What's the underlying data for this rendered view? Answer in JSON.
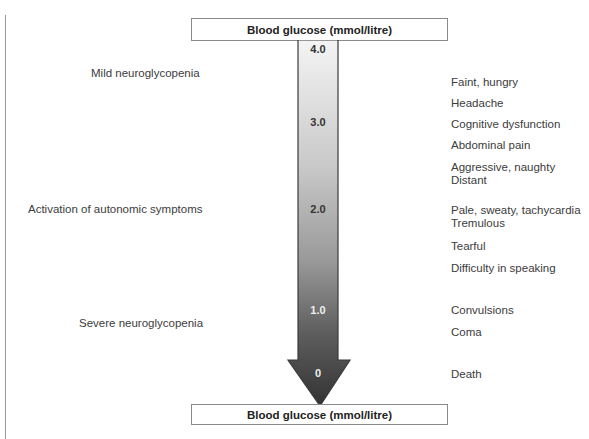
{
  "diagram": {
    "axis_title_top": "Blood glucose (mmol/litre)",
    "axis_title_bottom": "Blood glucose (mmol/litre)",
    "ticks": [
      {
        "value": "4.0",
        "y": 50
      },
      {
        "value": "3.0",
        "y": 123
      },
      {
        "value": "2.0",
        "y": 210
      },
      {
        "value": "1.0",
        "y": 311
      },
      {
        "value": "0",
        "y": 374
      }
    ],
    "stages": [
      {
        "label": "Mild neuroglycopenia",
        "x": 91,
        "y": 74
      },
      {
        "label": "Activation of autonomic symptoms",
        "x": 28,
        "y": 210
      },
      {
        "label": "Severe neuroglycopenia",
        "x": 79,
        "y": 324
      }
    ],
    "symptoms": [
      {
        "label": "Faint, hungry",
        "y": 82
      },
      {
        "label": "Headache",
        "y": 103
      },
      {
        "label": "Cognitive dysfunction",
        "y": 124
      },
      {
        "label": "Abdominal pain",
        "y": 145
      },
      {
        "label": "Aggressive, naughty",
        "y": 167
      },
      {
        "label": "Distant",
        "y": 180
      },
      {
        "label": "Pale, sweaty, tachycardia",
        "y": 210
      },
      {
        "label": "Tremulous",
        "y": 223
      },
      {
        "label": "Tearful",
        "y": 246
      },
      {
        "label": "Difficulty in speaking",
        "y": 268
      },
      {
        "label": "Convulsions",
        "y": 310
      },
      {
        "label": "Coma",
        "y": 332
      },
      {
        "label": "Death",
        "y": 374
      }
    ],
    "colors": {
      "arrow_top": "#f2f2f2",
      "arrow_bottom": "#3a3a3a",
      "border": "#8a8a8a"
    }
  }
}
